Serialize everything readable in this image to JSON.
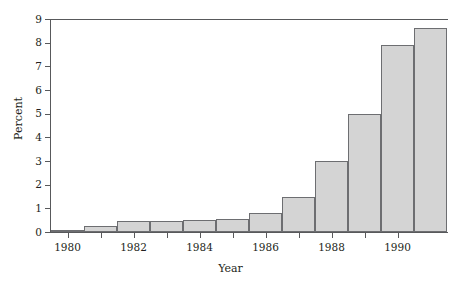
{
  "chart_data": {
    "type": "bar",
    "title": "",
    "subtitle": "",
    "xlabel": "Year",
    "ylabel": "Percent",
    "categories": [
      1980,
      1981,
      1982,
      1983,
      1984,
      1985,
      1986,
      1987,
      1988,
      1989,
      1990
    ],
    "values": [
      0.1,
      0.25,
      0.45,
      0.45,
      0.5,
      0.55,
      0.8,
      1.5,
      3.0,
      5.0,
      7.9
    ],
    "bars": [
      {
        "year": 1980,
        "value": 0.1
      },
      {
        "year": 1981,
        "value": 0.25
      },
      {
        "year": 1982,
        "value": 0.45
      },
      {
        "year": 1983,
        "value": 0.45
      },
      {
        "year": 1984,
        "value": 0.5
      },
      {
        "year": 1985,
        "value": 0.55
      },
      {
        "year": 1986,
        "value": 0.8
      },
      {
        "year": 1987,
        "value": 1.5
      },
      {
        "year": 1988,
        "value": 3.0
      },
      {
        "year": 1989,
        "value": 5.0
      },
      {
        "year": 1990,
        "value": 7.9
      }
    ],
    "note_last_bar": "A final taller bar reaching 8.6 is drawn at the right edge of the plot",
    "extra_bar": {
      "value": 8.6
    },
    "xlim": [
      1979.5,
      1991.5
    ],
    "ylim": [
      0,
      9
    ],
    "ytick_labels": [
      "0",
      "1",
      "2",
      "3",
      "4",
      "5",
      "6",
      "7",
      "8",
      "9"
    ],
    "ytick_values": [
      0,
      1,
      2,
      3,
      4,
      5,
      6,
      7,
      8,
      9
    ],
    "xtick_labels": [
      "1980",
      "1982",
      "1984",
      "1986",
      "1988",
      "1990"
    ],
    "xtick_values": [
      1980,
      1982,
      1984,
      1986,
      1988,
      1990
    ],
    "xminor_tick_values": [
      1981,
      1983,
      1985,
      1987,
      1989
    ],
    "grid": false,
    "legend": null,
    "colors": {
      "bar_fill": "#d4d4d4",
      "bar_edge": "#6d6e71",
      "axis": "#58595b",
      "text": "#231f20",
      "background": "#ffffff"
    }
  }
}
